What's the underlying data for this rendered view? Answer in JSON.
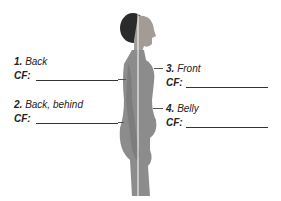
{
  "labels": [
    {
      "num": "1.",
      "text": "Back",
      "cf": "CF:"
    },
    {
      "num": "2.",
      "text": "Back, behind",
      "cf": "CF:"
    },
    {
      "num": "3.",
      "text": "Front",
      "cf": "CF:"
    },
    {
      "num": "4.",
      "text": "Belly",
      "cf": "CF:"
    }
  ],
  "colors": {
    "figure": "#8a8a8a",
    "hair": "#2a2a2a",
    "line": "#ffffff"
  }
}
